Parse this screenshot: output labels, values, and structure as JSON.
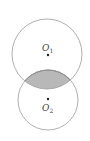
{
  "diagram": {
    "circle1": {
      "label": "O",
      "subscript": "1",
      "cx": 47,
      "cy": 54,
      "r": 35
    },
    "circle2": {
      "label": "O",
      "subscript": "2",
      "cx": 48,
      "cy": 100,
      "r": 30
    },
    "shaded_region": "intersection",
    "colors": {
      "stroke": "#9a9a9a",
      "shade": "#b8b8b8",
      "shade_stroke": "#555555",
      "dot": "#222222"
    }
  }
}
